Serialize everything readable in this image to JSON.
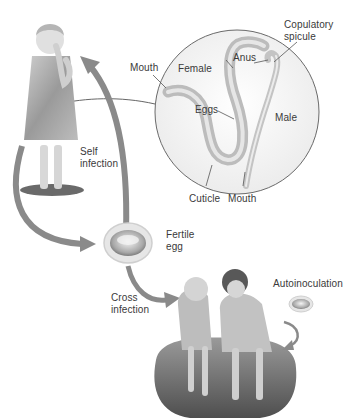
{
  "diagram": {
    "kind": "life-cycle",
    "colors": {
      "background": "#ffffff",
      "arrow": "#8a8a8a",
      "text": "#3a3a3a",
      "circle_outline": "#6a6a6a",
      "worm": "#c9c9c9"
    },
    "inset": {
      "labels": {
        "mouth_female": "Mouth",
        "female": "Female",
        "anus": "Anus",
        "copulatory_spicule": "Copulatory\nspicule",
        "eggs": "Eggs",
        "male": "Male",
        "cuticle": "Cuticle",
        "mouth_male": "Mouth"
      }
    },
    "labels": {
      "self_infection": "Self\ninfection",
      "fertile_egg": "Fertile\negg",
      "cross_infection": "Cross\ninfection",
      "autoinoculation": "Autoinoculation"
    },
    "nodes": [
      {
        "id": "child-standing",
        "label": "Child (hand to mouth)"
      },
      {
        "id": "worms-inset",
        "label": "Adult worms"
      },
      {
        "id": "fertile-egg",
        "label": "Fertile egg"
      },
      {
        "id": "two-children",
        "label": "Children sitting together"
      }
    ],
    "edges": [
      {
        "from": "worms-inset",
        "to": "child-standing",
        "label": ""
      },
      {
        "from": "fertile-egg",
        "to": "child-standing",
        "label": "Self infection"
      },
      {
        "from": "child-standing",
        "to": "fertile-egg",
        "label": ""
      },
      {
        "from": "fertile-egg",
        "to": "two-children",
        "label": "Cross infection"
      },
      {
        "from": "two-children",
        "to": "two-children",
        "label": "Autoinoculation"
      }
    ]
  }
}
